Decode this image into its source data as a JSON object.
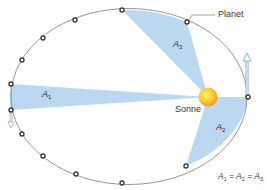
{
  "diagram": {
    "colors": {
      "sector_fill": "#bcd8f0",
      "orbit_stroke": "#8a8a8a",
      "dot_stroke": "#3b3b3b",
      "sun_inner": "#ffd23a",
      "sun_outer": "#f39a1c",
      "arrow_stroke": "#7fa6cc",
      "text": "#3a3a3a"
    },
    "labels": {
      "planet": "Planet",
      "sun": "Sonne",
      "a1_letter": "A",
      "a1_sub": "1",
      "a2_letter": "A",
      "a2_sub": "2",
      "a3_letter": "A",
      "a3_sub": "3",
      "equation": {
        "t1": "A",
        "s1": "1",
        "eq1": " = ",
        "t2": "A",
        "s2": "2",
        "eq2": " = ",
        "t3": "A",
        "s3": "3"
      }
    },
    "orbit": {
      "cx": 129,
      "cy": 96.5,
      "rx": 118,
      "ry": 88
    },
    "sun": {
      "x": 208,
      "y": 97,
      "r": 9
    },
    "planet_positions": [
      [
        11,
        84
      ],
      [
        22,
        60
      ],
      [
        43,
        38
      ],
      [
        75,
        20
      ],
      [
        122,
        10
      ],
      [
        187,
        22
      ],
      [
        248,
        97
      ],
      [
        186,
        166
      ],
      [
        122,
        183
      ],
      [
        76,
        174
      ],
      [
        43,
        156
      ],
      [
        22,
        134
      ],
      [
        11,
        110
      ]
    ],
    "sectors": [
      {
        "name": "A1",
        "from": [
          11,
          84
        ],
        "to": [
          11,
          110
        ]
      },
      {
        "name": "A3",
        "from": [
          122,
          10
        ],
        "to": [
          187,
          22
        ]
      },
      {
        "name": "A2",
        "from": [
          248,
          97
        ],
        "to": [
          186,
          166
        ]
      }
    ]
  }
}
